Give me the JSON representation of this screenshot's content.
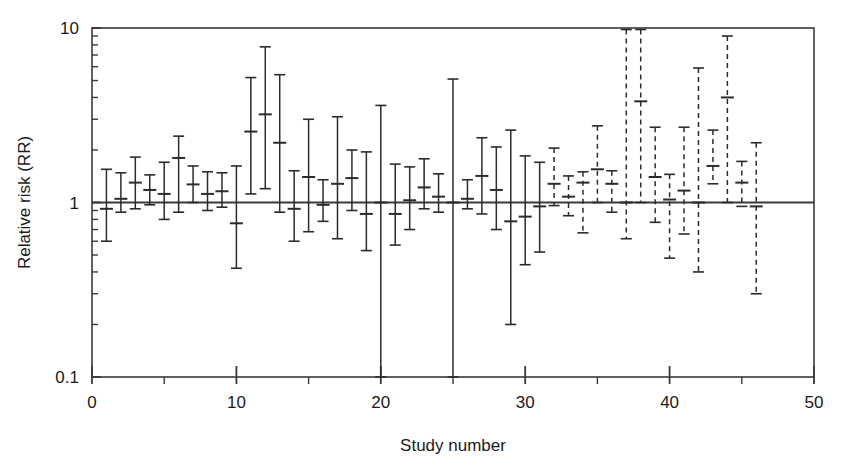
{
  "chart_data": {
    "type": "scatter",
    "title": "",
    "subtitle": "",
    "xlabel": "Study number",
    "ylabel": "Relative risk (RR)",
    "yscale": "log",
    "ylim": [
      0.1,
      10
    ],
    "xlim": [
      0,
      50
    ],
    "y_tick_labels": [
      "0.1",
      "1",
      "10"
    ],
    "y_tick_values": [
      0.1,
      1,
      10
    ],
    "x_tick_labels": [
      "0",
      "10",
      "20",
      "30",
      "40",
      "50"
    ],
    "x_tick_values": [
      0,
      10,
      20,
      30,
      40,
      50
    ],
    "x_minor_ticks": [
      5,
      15,
      25,
      35,
      45
    ],
    "grid": false,
    "legend": null,
    "reference_line": {
      "y": 1.0,
      "style": "solid",
      "color": "#3a3a3a"
    },
    "annotations": [
      {
        "text": "Solid error bars: studies 1-31",
        "style": "solid"
      },
      {
        "text": "Dashed error bars: studies 32-46",
        "style": "dashed"
      }
    ],
    "series": [
      {
        "name": "Relative risk with 95% CI",
        "marker": "horizontal-dash",
        "color": "#2b2b2b",
        "points": [
          {
            "x": 1,
            "y": 0.92,
            "lo": 0.6,
            "hi": 1.55,
            "style": "solid"
          },
          {
            "x": 2,
            "y": 1.05,
            "lo": 0.88,
            "hi": 1.48,
            "style": "solid"
          },
          {
            "x": 3,
            "y": 1.3,
            "lo": 0.92,
            "hi": 1.82,
            "style": "solid"
          },
          {
            "x": 4,
            "y": 1.18,
            "lo": 0.97,
            "hi": 1.44,
            "style": "solid"
          },
          {
            "x": 5,
            "y": 1.12,
            "lo": 0.8,
            "hi": 1.7,
            "style": "solid"
          },
          {
            "x": 6,
            "y": 1.8,
            "lo": 0.88,
            "hi": 2.4,
            "style": "solid"
          },
          {
            "x": 7,
            "y": 1.27,
            "lo": 1.0,
            "hi": 1.62,
            "style": "solid"
          },
          {
            "x": 8,
            "y": 1.12,
            "lo": 0.9,
            "hi": 1.5,
            "style": "solid"
          },
          {
            "x": 9,
            "y": 1.16,
            "lo": 0.94,
            "hi": 1.48,
            "style": "solid"
          },
          {
            "x": 10,
            "y": 0.76,
            "lo": 0.42,
            "hi": 1.62,
            "style": "solid"
          },
          {
            "x": 11,
            "y": 2.55,
            "lo": 1.12,
            "hi": 5.2,
            "style": "solid"
          },
          {
            "x": 12,
            "y": 3.2,
            "lo": 1.2,
            "hi": 7.8,
            "style": "solid"
          },
          {
            "x": 13,
            "y": 2.2,
            "lo": 0.88,
            "hi": 5.4,
            "style": "solid"
          },
          {
            "x": 14,
            "y": 0.92,
            "lo": 0.6,
            "hi": 1.52,
            "style": "solid"
          },
          {
            "x": 15,
            "y": 1.4,
            "lo": 0.68,
            "hi": 3.0,
            "style": "solid"
          },
          {
            "x": 16,
            "y": 0.97,
            "lo": 0.78,
            "hi": 1.35,
            "style": "solid"
          },
          {
            "x": 17,
            "y": 1.28,
            "lo": 0.62,
            "hi": 3.1,
            "style": "solid"
          },
          {
            "x": 18,
            "y": 1.38,
            "lo": 0.9,
            "hi": 2.0,
            "style": "solid"
          },
          {
            "x": 19,
            "y": 0.86,
            "lo": 0.53,
            "hi": 1.95,
            "style": "solid"
          },
          {
            "x": 20,
            "y": 1.0,
            "lo": 0.1,
            "hi": 3.6,
            "style": "solid"
          },
          {
            "x": 21,
            "y": 0.86,
            "lo": 0.57,
            "hi": 1.66,
            "style": "solid"
          },
          {
            "x": 22,
            "y": 1.03,
            "lo": 0.7,
            "hi": 1.6,
            "style": "solid"
          },
          {
            "x": 23,
            "y": 1.22,
            "lo": 0.92,
            "hi": 1.78,
            "style": "solid"
          },
          {
            "x": 24,
            "y": 1.08,
            "lo": 0.88,
            "hi": 1.46,
            "style": "solid"
          },
          {
            "x": 25,
            "y": 1.0,
            "lo": 0.1,
            "hi": 5.1,
            "style": "solid"
          },
          {
            "x": 26,
            "y": 1.05,
            "lo": 0.92,
            "hi": 1.35,
            "style": "solid"
          },
          {
            "x": 27,
            "y": 1.42,
            "lo": 0.86,
            "hi": 2.35,
            "style": "solid"
          },
          {
            "x": 28,
            "y": 1.18,
            "lo": 0.7,
            "hi": 2.08,
            "style": "solid"
          },
          {
            "x": 29,
            "y": 0.78,
            "lo": 0.2,
            "hi": 2.6,
            "style": "solid"
          },
          {
            "x": 30,
            "y": 0.83,
            "lo": 0.44,
            "hi": 1.85,
            "style": "solid"
          },
          {
            "x": 31,
            "y": 0.95,
            "lo": 0.52,
            "hi": 1.7,
            "style": "solid"
          },
          {
            "x": 32,
            "y": 1.28,
            "lo": 0.96,
            "hi": 2.05,
            "style": "dashed"
          },
          {
            "x": 33,
            "y": 1.08,
            "lo": 0.84,
            "hi": 1.42,
            "style": "dashed"
          },
          {
            "x": 34,
            "y": 1.3,
            "lo": 0.67,
            "hi": 1.5,
            "style": "dashed"
          },
          {
            "x": 35,
            "y": 1.55,
            "lo": 1.0,
            "hi": 2.75,
            "style": "dashed"
          },
          {
            "x": 36,
            "y": 1.28,
            "lo": 0.88,
            "hi": 1.52,
            "style": "dashed"
          },
          {
            "x": 37,
            "y": 1.0,
            "lo": 0.62,
            "hi": 9.8,
            "style": "dashed"
          },
          {
            "x": 38,
            "y": 3.8,
            "lo": 1.0,
            "hi": 9.8,
            "style": "dashed"
          },
          {
            "x": 39,
            "y": 1.4,
            "lo": 0.77,
            "hi": 2.7,
            "style": "dashed"
          },
          {
            "x": 40,
            "y": 1.04,
            "lo": 0.48,
            "hi": 1.45,
            "style": "dashed"
          },
          {
            "x": 41,
            "y": 1.17,
            "lo": 0.66,
            "hi": 2.7,
            "style": "dashed"
          },
          {
            "x": 42,
            "y": 1.0,
            "lo": 0.4,
            "hi": 5.9,
            "style": "dashed"
          },
          {
            "x": 43,
            "y": 1.62,
            "lo": 1.28,
            "hi": 2.6,
            "style": "dashed"
          },
          {
            "x": 44,
            "y": 4.0,
            "lo": 1.0,
            "hi": 9.0,
            "style": "dashed"
          },
          {
            "x": 45,
            "y": 1.3,
            "lo": 0.95,
            "hi": 1.72,
            "style": "dashed"
          },
          {
            "x": 46,
            "y": 0.95,
            "lo": 0.3,
            "hi": 2.2,
            "style": "dashed"
          }
        ]
      }
    ]
  },
  "style": {
    "axis_color": "#3a3a3a",
    "bar_color": "#2b2b2b",
    "background": "#ffffff"
  }
}
